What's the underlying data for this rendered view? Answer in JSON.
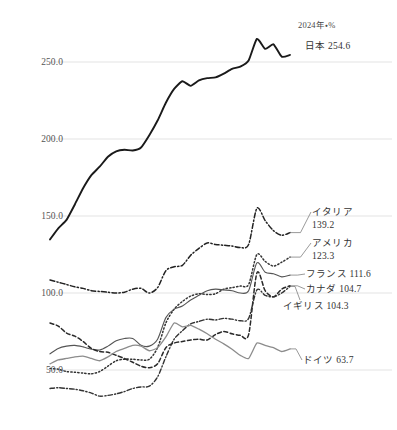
{
  "chart_data": {
    "type": "line",
    "title": "",
    "subtitle": "",
    "unit_note": "2024年・%",
    "xlabel": "",
    "ylabel": "",
    "ylim": [
      20,
      275
    ],
    "yticks": [
      50.0,
      100.0,
      150.0,
      200.0,
      250.0
    ],
    "ytick_labels": [
      "50.0",
      "100.0",
      "150.0",
      "200.0",
      "250.0"
    ],
    "grid": "horizontal",
    "legend_position": "right-inline",
    "x": [
      1995,
      1996,
      1997,
      1998,
      1999,
      2000,
      2001,
      2002,
      2003,
      2004,
      2005,
      2006,
      2007,
      2008,
      2009,
      2010,
      2011,
      2012,
      2013,
      2014,
      2015,
      2016,
      2017,
      2018,
      2019,
      2020,
      2021,
      2022,
      2023,
      2024
    ],
    "series": [
      {
        "name": "日本",
        "label": "日本 254.6",
        "end_value": 254.6,
        "color": "#1a1a1a",
        "style": "solid",
        "width": 1.9,
        "values": [
          134.8,
          142.0,
          147.5,
          157.5,
          168.0,
          176.5,
          182.0,
          188.5,
          192.0,
          193.0,
          192.5,
          194.5,
          202.5,
          212.0,
          223.5,
          232.5,
          237.5,
          234.5,
          238.0,
          239.5,
          240.0,
          242.5,
          245.5,
          247.0,
          251.0,
          265.0,
          258.5,
          261.5,
          253.5,
          254.6
        ]
      },
      {
        "name": "イタリア",
        "label": "イタリア 139.2",
        "end_value": 139.2,
        "color": "#222222",
        "style": "dashdot",
        "width": 1.5,
        "values": [
          108.5,
          107.0,
          105.5,
          104.0,
          103.0,
          101.5,
          101.0,
          100.5,
          100.0,
          100.5,
          102.5,
          103.0,
          100.0,
          103.5,
          114.5,
          117.0,
          118.0,
          124.5,
          129.0,
          132.5,
          131.5,
          131.0,
          130.5,
          129.5,
          131.5,
          155.0,
          147.0,
          140.5,
          137.5,
          139.2
        ]
      },
      {
        "name": "アメリカ",
        "label": "アメリカ 123.3",
        "end_value": 123.3,
        "color": "#333333",
        "style": "dotted",
        "width": 1.5,
        "values": [
          51.0,
          50.5,
          49.0,
          48.5,
          48.0,
          47.5,
          49.0,
          52.5,
          56.0,
          57.0,
          57.0,
          56.5,
          57.0,
          64.5,
          80.5,
          89.5,
          94.5,
          98.0,
          99.5,
          99.0,
          99.5,
          102.5,
          103.5,
          104.5,
          105.5,
          125.0,
          120.5,
          117.5,
          120.0,
          123.3
        ]
      },
      {
        "name": "フランス",
        "label": "フランス 111.6",
        "end_value": 111.6,
        "color": "#555555",
        "style": "solid",
        "width": 1.1,
        "values": [
          60.5,
          64.0,
          65.5,
          66.0,
          65.0,
          63.5,
          63.0,
          65.5,
          69.0,
          70.5,
          70.5,
          66.0,
          65.5,
          70.0,
          84.0,
          89.5,
          91.5,
          95.5,
          98.5,
          101.5,
          102.5,
          102.0,
          101.5,
          100.0,
          101.5,
          119.5,
          113.5,
          112.5,
          110.5,
          111.6
        ]
      },
      {
        "name": "カナダ",
        "label": "カナダ 104.7",
        "end_value": 104.7,
        "color": "#2a2a2a",
        "style": "dashed",
        "width": 1.5,
        "values": [
          80.5,
          78.5,
          74.0,
          72.0,
          68.5,
          64.0,
          62.0,
          61.5,
          59.5,
          57.5,
          55.0,
          52.5,
          51.5,
          54.0,
          64.5,
          67.5,
          68.5,
          69.5,
          70.0,
          69.5,
          73.0,
          75.0,
          73.5,
          72.5,
          73.0,
          113.0,
          101.5,
          97.5,
          102.5,
          104.7
        ]
      },
      {
        "name": "イギリス",
        "label": "イギリス 104.3",
        "end_value": 104.3,
        "color": "#333333",
        "style": "dashdot",
        "width": 1.4,
        "values": [
          38.0,
          38.5,
          38.0,
          37.5,
          36.5,
          35.0,
          33.0,
          33.5,
          34.5,
          36.0,
          38.0,
          39.0,
          39.5,
          45.5,
          58.5,
          70.0,
          75.5,
          80.0,
          81.5,
          83.0,
          82.5,
          83.5,
          83.0,
          82.0,
          83.5,
          102.0,
          98.5,
          97.5,
          100.0,
          104.3
        ]
      },
      {
        "name": "ドイツ",
        "label": "ドイツ 63.7",
        "end_value": 63.7,
        "color": "#8c8c8c",
        "style": "solid",
        "width": 1.3,
        "values": [
          54.0,
          56.5,
          57.5,
          58.5,
          59.0,
          57.5,
          56.0,
          58.5,
          62.0,
          64.0,
          66.0,
          65.5,
          62.5,
          64.5,
          71.5,
          80.5,
          78.0,
          79.0,
          76.5,
          73.5,
          70.0,
          67.0,
          63.5,
          59.5,
          57.5,
          67.5,
          66.0,
          64.5,
          62.0,
          63.7
        ]
      }
    ]
  },
  "labels": {
    "japan": "日本 254.6",
    "italy_name": "イタリア",
    "italy_value": "139.2",
    "america_name": "アメリカ",
    "america_value": "123.3",
    "france": "フランス 111.6",
    "canada": "カナダ 104.7",
    "uk": "イギリス 104.3",
    "germany": "ドイツ 63.7"
  },
  "axis": {
    "y1": "50.0",
    "y2": "100.0",
    "y3": "150.0",
    "y4": "200.0",
    "y5": "250.0"
  },
  "note": "2024年・%"
}
